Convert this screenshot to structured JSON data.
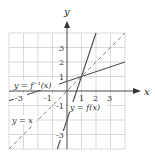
{
  "diagram": {
    "type": "function-graph",
    "axes": {
      "x_label": "x",
      "y_label": "y",
      "x_range": [
        -4,
        4
      ],
      "y_range": [
        -4,
        4
      ],
      "x_ticks": [
        "-3",
        "-1",
        "1",
        "2",
        "3"
      ],
      "y_ticks": [
        "3",
        "2",
        "1",
        "-1",
        "-3"
      ]
    },
    "curves": [
      {
        "name": "f",
        "label": "y = f(x)",
        "equation": "y = 3x - 2",
        "style": "solid"
      },
      {
        "name": "f_inverse",
        "label": "y = f⁻¹(x)",
        "equation": "y = (x + 2)/3",
        "style": "solid"
      },
      {
        "name": "identity",
        "label": "y = x",
        "equation": "y = x",
        "style": "dashed"
      }
    ],
    "intersection": {
      "x": 1,
      "y": 1
    },
    "colors": {
      "grid": "#cccccc",
      "axis": "#333333",
      "lines": "#555555",
      "text": "#333333"
    }
  }
}
